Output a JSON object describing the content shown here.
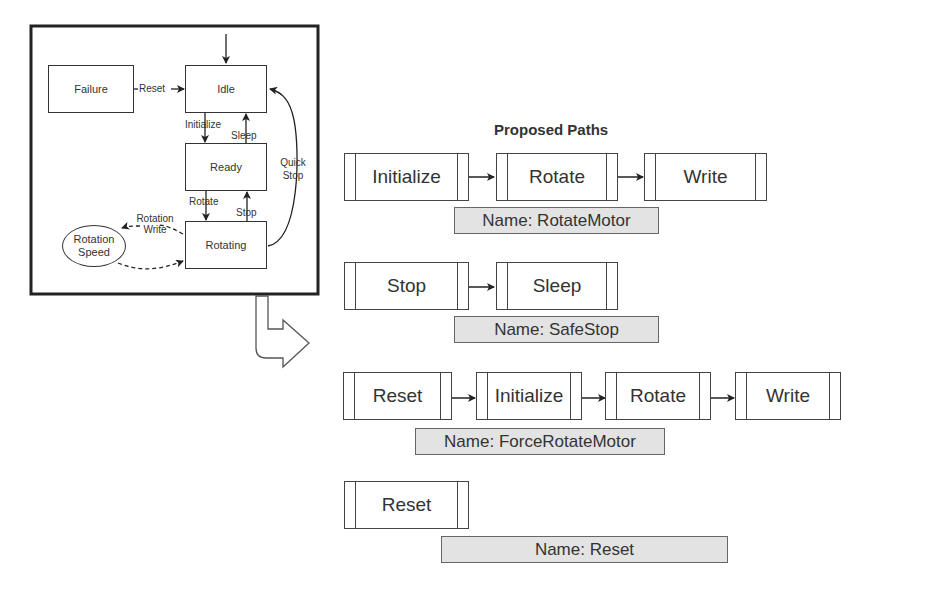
{
  "state_machine": {
    "states": {
      "failure": "Failure",
      "idle": "Idle",
      "ready": "Ready",
      "rotating": "Rotating",
      "rotation_speed": "Rotation Speed"
    },
    "transitions": {
      "reset": "Reset",
      "initialize": "Initialize",
      "sleep": "Sleep",
      "rotate": "Rotate",
      "stop": "Stop",
      "quick_stop": "Quick Stop",
      "rotation_write": "Rotation Write"
    }
  },
  "proposed": {
    "title": "Proposed Paths",
    "paths": [
      {
        "steps": [
          "Initialize",
          "Rotate",
          "Write"
        ],
        "name": "Name: RotateMotor"
      },
      {
        "steps": [
          "Stop",
          "Sleep"
        ],
        "name": "Name: SafeStop"
      },
      {
        "steps": [
          "Reset",
          "Initialize",
          "Rotate",
          "Write"
        ],
        "name": "Name: ForceRotateMotor"
      },
      {
        "steps": [
          "Reset"
        ],
        "name": "Name: Reset"
      }
    ]
  }
}
